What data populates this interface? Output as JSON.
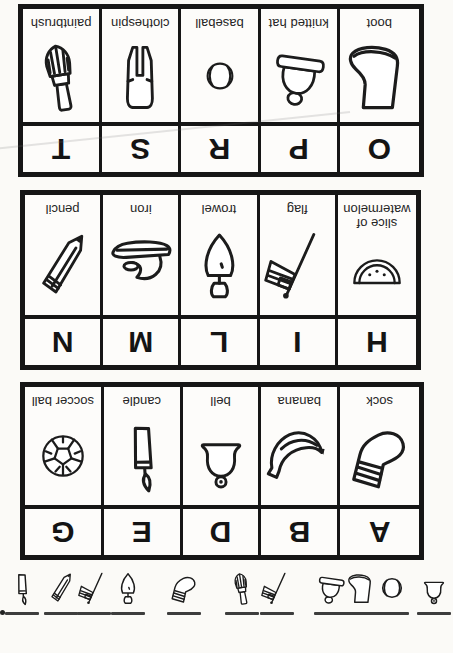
{
  "worksheet": {
    "page": {
      "rotation_degrees": 180
    },
    "tables": [
      {
        "letters": [
          "A",
          "B",
          "D",
          "E",
          "G"
        ],
        "items": [
          {
            "label": "sock",
            "icon": "sock"
          },
          {
            "label": "banana",
            "icon": "banana"
          },
          {
            "label": "bell",
            "icon": "bell"
          },
          {
            "label": "candle",
            "icon": "candle"
          },
          {
            "label": "soccer ball",
            "icon": "soccer-ball"
          }
        ]
      },
      {
        "letters": [
          "H",
          "I",
          "L",
          "M",
          "N"
        ],
        "items": [
          {
            "label": "slice of watermelon",
            "icon": "watermelon"
          },
          {
            "label": "flag",
            "icon": "flag"
          },
          {
            "label": "trowel",
            "icon": "trowel"
          },
          {
            "label": "iron",
            "icon": "iron"
          },
          {
            "label": "pencil",
            "icon": "pencil"
          }
        ]
      },
      {
        "letters": [
          "O",
          "P",
          "R",
          "S",
          "T"
        ],
        "items": [
          {
            "label": "boot",
            "icon": "boot"
          },
          {
            "label": "knitted hat",
            "icon": "knitted-hat"
          },
          {
            "label": "baseball",
            "icon": "baseball"
          },
          {
            "label": "clothespin",
            "icon": "clothespin"
          },
          {
            "label": "paintbrush",
            "icon": "paintbrush"
          }
        ]
      }
    ],
    "answer_strip": {
      "icons": [
        "bell",
        "baseball",
        "boot",
        "knitted-hat",
        "flag",
        "paintbrush",
        "sock",
        "trowel",
        "flag",
        "pencil",
        "candle"
      ]
    },
    "colors": {
      "ink": "#1c1c1c",
      "paper": "#fbfaf7",
      "blank_line": "#3d3d3d"
    }
  }
}
